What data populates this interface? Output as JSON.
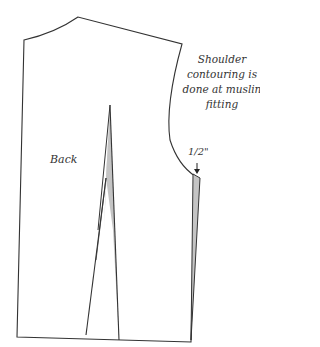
{
  "diagram": {
    "type": "sewing-pattern",
    "piece_label": "Back",
    "annotation": "Shoulder contouring is done at muslin fitting",
    "measurement": "1/2\"",
    "colors": {
      "outline": "#333333",
      "dart_fill": "#c4c4c4",
      "background": "#ffffff"
    }
  }
}
